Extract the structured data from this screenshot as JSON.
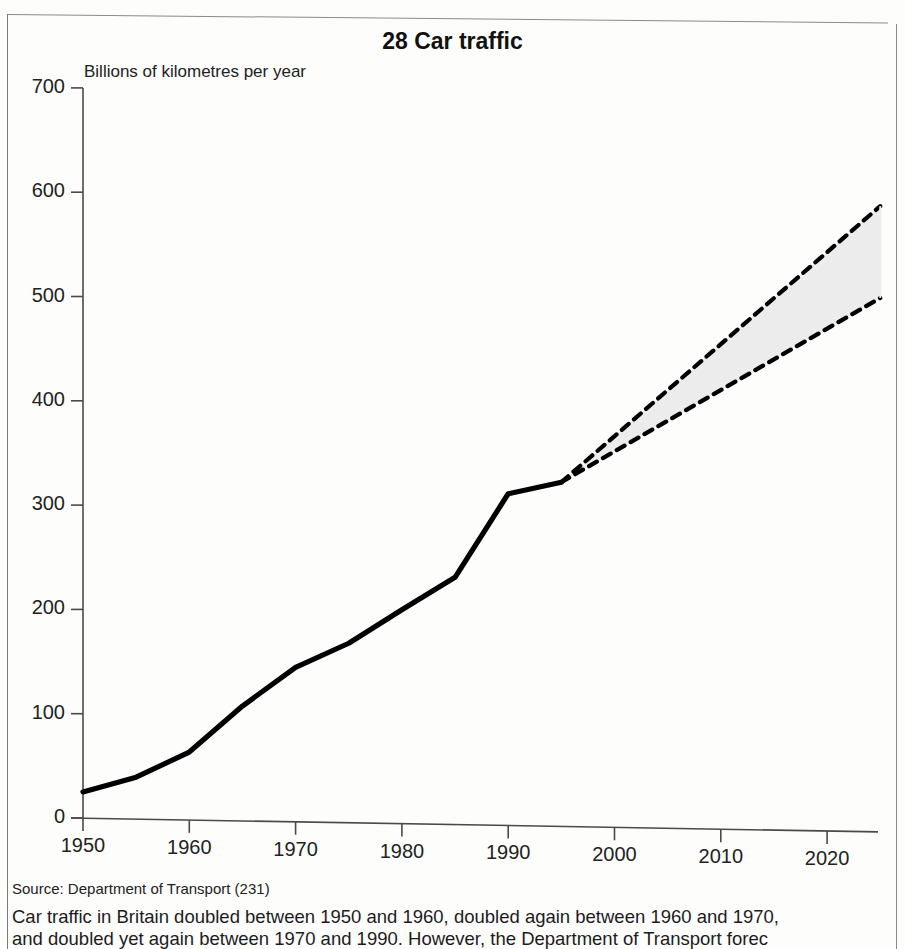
{
  "figure": {
    "title": "28 Car traffic",
    "axis_note": "Billions of kilometres per year",
    "source": "Source: Department of Transport (231)",
    "caption_lines": [
      "Car traffic in Britain doubled between 1950 and 1960, doubled again between 1960 and 1970,",
      "and doubled yet again between 1970 and 1990. However, the Department of Transport forec"
    ]
  },
  "chart_data": {
    "type": "line",
    "title": "28 Car traffic",
    "subtitle": "Billions of kilometres per year",
    "xlabel": "",
    "ylabel": "Billions of kilometres per year",
    "xlim": [
      1950,
      2025
    ],
    "ylim": [
      0,
      700
    ],
    "yticks": [
      0,
      100,
      200,
      300,
      400,
      500,
      600,
      700
    ],
    "ytick_labels": [
      "0",
      "100",
      "200",
      "300",
      "400",
      "500",
      "600",
      "700"
    ],
    "xticks": [
      1950,
      1960,
      1970,
      1980,
      1990,
      2000,
      2010,
      2020
    ],
    "xtick_labels": [
      "1950",
      "1960",
      "1970",
      "1980",
      "1990",
      "2000",
      "2010",
      "2020"
    ],
    "grid": false,
    "legend": null,
    "series": [
      {
        "name": "Actual car traffic",
        "style": "solid",
        "x": [
          1950,
          1955,
          1960,
          1965,
          1970,
          1975,
          1980,
          1985,
          1990,
          1995
        ],
        "values": [
          25,
          40,
          65,
          110,
          148,
          172,
          205,
          237,
          318,
          330
        ]
      },
      {
        "name": "Forecast high",
        "style": "dashed",
        "x": [
          1995,
          2025
        ],
        "values": [
          330,
          600
        ]
      },
      {
        "name": "Forecast low",
        "style": "dashed",
        "x": [
          1995,
          2025
        ],
        "values": [
          330,
          512
        ]
      }
    ],
    "forecast_band": {
      "fill": "#ececec",
      "x": [
        1995,
        2025
      ],
      "upper": [
        330,
        600
      ],
      "lower": [
        330,
        512
      ]
    },
    "colors": {
      "line": "#000000",
      "axis": "#444444",
      "band_fill": "#ececec"
    }
  }
}
